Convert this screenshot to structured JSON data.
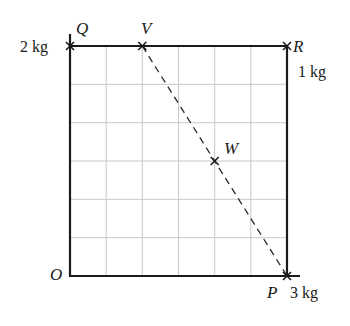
{
  "diagram": {
    "type": "grid-lamina-centre-of-mass",
    "grid": {
      "columns": 6,
      "rows": 6
    },
    "points": {
      "O": {
        "label": "O",
        "grid": [
          0,
          0
        ]
      },
      "Q": {
        "label": "Q",
        "grid": [
          0,
          6
        ],
        "mass": "2 kg"
      },
      "R": {
        "label": "R",
        "grid": [
          6,
          6
        ],
        "mass": "1 kg"
      },
      "P": {
        "label": "P",
        "grid": [
          6,
          0
        ],
        "mass": "3 kg"
      },
      "V": {
        "label": "V",
        "grid": [
          2,
          6
        ]
      },
      "W": {
        "label": "W",
        "grid": [
          4,
          3
        ]
      }
    },
    "dashed_line": {
      "from": "V",
      "to": "P"
    },
    "colors": {
      "frame": "#1a1a1a",
      "grid": "#c8c8c8",
      "dash": "#2a2a2a"
    }
  }
}
